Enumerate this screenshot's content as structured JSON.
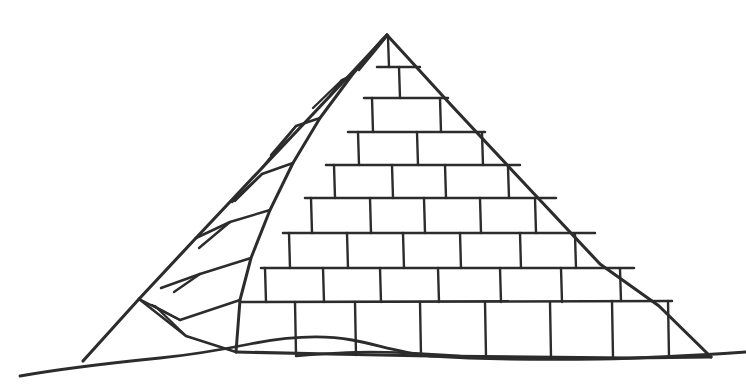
{
  "document": {
    "title": "Pyramid",
    "subject": "Great Pyramid line drawing",
    "medium": "black ink line art on white background",
    "caption": "Line drawing of a stepped stone pyramid standing on rolling desert sand"
  },
  "canvas": {
    "width": 746,
    "height": 391,
    "background_color": "#ffffff",
    "ink_color": "#2c2c2c"
  },
  "figure": {
    "name": "pyramid",
    "apex": {
      "x": 387,
      "y": 35
    },
    "left_base_corner": {
      "x": 83,
      "y": 361
    },
    "right_base_corner": {
      "x": 711,
      "y": 357
    },
    "ridge_base": {
      "x": 236,
      "y": 352
    },
    "faces": [
      {
        "name": "front-face",
        "label": "Sunlit front face",
        "course_count": 9,
        "description": "Large quadrilateral face facing the viewer, laid in staggered ashlar courses"
      },
      {
        "name": "side-face",
        "label": "Shadowed left side face",
        "course_count": 7,
        "description": "Narrow foreshortened face receding to the left, courses slope down to the left"
      }
    ]
  },
  "front_face": {
    "name": "front-face-courses",
    "course_tops_y": [
      35,
      67,
      98,
      132,
      165,
      198,
      233,
      268,
      302,
      357
    ],
    "joints": {
      "row_1": [],
      "row_2": [
        399
      ],
      "row_3": [
        372,
        440
      ],
      "row_4": [
        358,
        417,
        482
      ],
      "row_5": [
        334,
        392,
        445,
        508
      ],
      "row_6": [
        311,
        370,
        424,
        480,
        535
      ],
      "row_7": [
        289,
        347,
        403,
        460,
        520,
        565
      ],
      "row_8": [
        265,
        323,
        380,
        438,
        500,
        561,
        613
      ],
      "row_9": [
        295,
        355,
        420,
        485,
        550,
        612,
        668
      ]
    }
  },
  "side_face": {
    "name": "side-face-courses",
    "course_count": 7,
    "description": "Seven slanted courses running parallel to the base, each subdivided by one or two slanted joints",
    "joint_counts": [
      0,
      1,
      1,
      1,
      1,
      1,
      1
    ]
  },
  "ground": {
    "name": "desert-ground",
    "label": "Sand dune horizon",
    "left_end": {
      "x": 20,
      "y": 376
    },
    "right_end": {
      "x": 746,
      "y": 352
    },
    "description": "Two overlapping wavy sand-dune contour lines crossing in front of the pyramid base"
  },
  "legend": {
    "visible": false,
    "items": []
  }
}
